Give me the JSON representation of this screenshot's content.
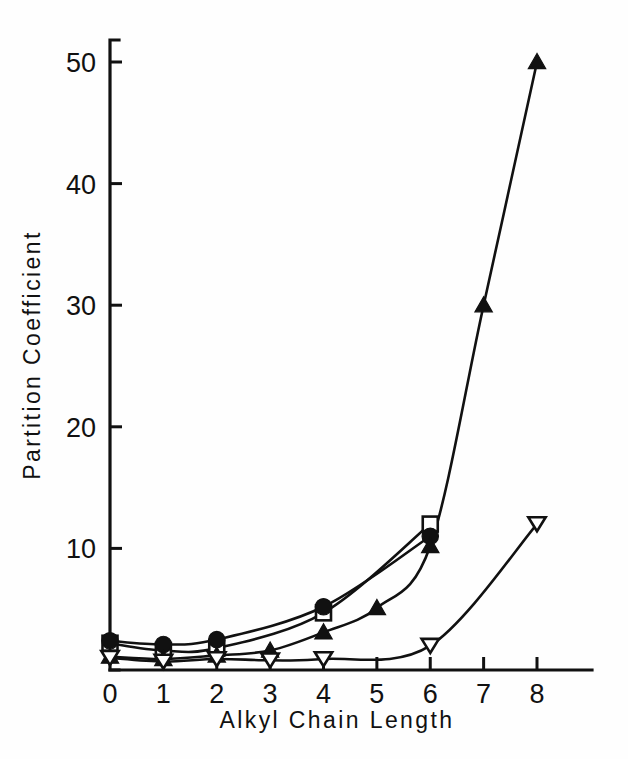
{
  "chart_data": {
    "type": "line",
    "title": "",
    "subtitle": "",
    "xlabel": "Alkyl  Chain  Length",
    "ylabel": "Partition  Coefficient",
    "xlim": [
      0,
      8.6
    ],
    "ylim": [
      0,
      52
    ],
    "x_ticks": [
      0,
      1,
      2,
      3,
      4,
      5,
      6,
      7,
      8
    ],
    "x_ticklabels": [
      "0",
      "1",
      "2",
      "3",
      "4",
      "5",
      "6",
      "7",
      "8"
    ],
    "y_ticks": [
      10,
      20,
      30,
      40,
      50
    ],
    "y_ticklabels": [
      "10",
      "20",
      "30",
      "40",
      "50"
    ],
    "grid": false,
    "legend": "none",
    "axis_color": "#111111",
    "series": [
      {
        "name": "open-square",
        "marker": "square-open",
        "x": [
          0,
          1,
          2,
          4,
          6
        ],
        "values": [
          2.2,
          1.6,
          1.8,
          4.7,
          12.0
        ]
      },
      {
        "name": "filled-circle",
        "marker": "circle-filled",
        "x": [
          0,
          1,
          2,
          4,
          6
        ],
        "values": [
          2.4,
          2.1,
          2.5,
          5.2,
          11.0
        ]
      },
      {
        "name": "filled-triangle",
        "marker": "triangle-filled",
        "x": [
          0,
          1,
          2,
          3,
          4,
          5,
          6,
          7,
          8
        ],
        "values": [
          1.1,
          0.9,
          1.2,
          1.6,
          3.1,
          5.1,
          10.2,
          30.0,
          50.0
        ]
      },
      {
        "name": "open-inverted-triangle",
        "marker": "triangle-down-open",
        "x": [
          0,
          1,
          2,
          3,
          4,
          6,
          8
        ],
        "values": [
          1.0,
          0.7,
          0.9,
          0.8,
          0.9,
          2.0,
          12.0
        ]
      }
    ]
  },
  "figure": {
    "background_color": "#fefefe",
    "line_color": "#111111"
  }
}
